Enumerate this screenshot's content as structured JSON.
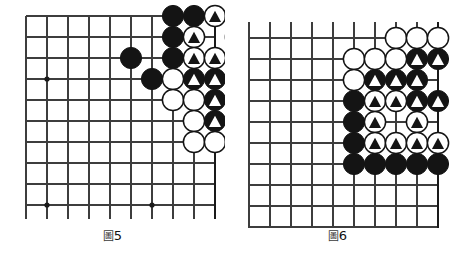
{
  "page": {
    "background": "#ffffff",
    "width": 450,
    "height": 261
  },
  "colors": {
    "line": "#3d3d3d",
    "border": "#1a1a1a",
    "black_stone": "#141414",
    "white_stone": "#ffffff",
    "stone_outline": "#141414",
    "mark_on_black": "#ffffff",
    "mark_on_white": "#141414",
    "star_point": "#1a1a1a",
    "caption_text": "#111111"
  },
  "figures": [
    {
      "id": "figure-5",
      "caption_cjk": "圖",
      "caption_number": "5",
      "caption_full": "圖5",
      "grid": {
        "cols": 10,
        "rows": 10,
        "x0": 26,
        "y0": 16,
        "spacing": 21,
        "edges": {
          "top": false,
          "right": true,
          "bottom": false,
          "left": false
        },
        "lines_overhang": {
          "top": 0,
          "bottom": 14,
          "left": 0,
          "right": 0
        }
      },
      "star_points": [
        {
          "col": 2,
          "row": 4
        },
        {
          "col": 2,
          "row": 10
        },
        {
          "col": 7,
          "row": 10
        }
      ],
      "stones": [
        {
          "col": 8,
          "row": 1,
          "color": "black",
          "mark": "none"
        },
        {
          "col": 9,
          "row": 1,
          "color": "black",
          "mark": "none"
        },
        {
          "col": 10,
          "row": 1,
          "color": "white",
          "mark": "triangle"
        },
        {
          "col": 11,
          "row": 1,
          "color": "white",
          "mark": "triangle"
        },
        {
          "col": 8,
          "row": 2,
          "color": "black",
          "mark": "none"
        },
        {
          "col": 9,
          "row": 2,
          "color": "white",
          "mark": "triangle"
        },
        {
          "col": 11,
          "row": 2,
          "color": "white",
          "mark": "triangle"
        },
        {
          "col": 6,
          "row": 3,
          "color": "black",
          "mark": "none"
        },
        {
          "col": 8,
          "row": 3,
          "color": "black",
          "mark": "none"
        },
        {
          "col": 9,
          "row": 3,
          "color": "white",
          "mark": "triangle"
        },
        {
          "col": 10,
          "row": 3,
          "color": "white",
          "mark": "triangle"
        },
        {
          "col": 7,
          "row": 4,
          "color": "black",
          "mark": "none"
        },
        {
          "col": 8,
          "row": 4,
          "color": "white",
          "mark": "none"
        },
        {
          "col": 9,
          "row": 4,
          "color": "black",
          "mark": "triangle"
        },
        {
          "col": 10,
          "row": 4,
          "color": "black",
          "mark": "triangle"
        },
        {
          "col": 11,
          "row": 4,
          "color": "black",
          "mark": "triangle"
        },
        {
          "col": 8,
          "row": 5,
          "color": "white",
          "mark": "none"
        },
        {
          "col": 9,
          "row": 5,
          "color": "white",
          "mark": "none"
        },
        {
          "col": 10,
          "row": 5,
          "color": "black",
          "mark": "triangle"
        },
        {
          "col": 9,
          "row": 6,
          "color": "white",
          "mark": "none"
        },
        {
          "col": 10,
          "row": 6,
          "color": "black",
          "mark": "triangle"
        },
        {
          "col": 11,
          "row": 6,
          "color": "black",
          "mark": "triangle"
        },
        {
          "col": 9,
          "row": 7,
          "color": "white",
          "mark": "none"
        },
        {
          "col": 10,
          "row": 7,
          "color": "white",
          "mark": "none"
        },
        {
          "col": 11,
          "row": 7,
          "color": "white",
          "mark": "none"
        }
      ]
    },
    {
      "id": "figure-6",
      "caption_cjk": "圖",
      "caption_number": "6",
      "caption_full": "圖6",
      "grid": {
        "cols": 10,
        "rows": 10,
        "x0": 24,
        "y0": 38,
        "spacing": 21,
        "edges": {
          "top": false,
          "right": true,
          "bottom": false,
          "left": false
        },
        "lines_overhang": {
          "top": 16,
          "bottom": 14,
          "left": 0,
          "right": 0
        }
      },
      "star_points": [],
      "stones": [
        {
          "col": 8,
          "row": 1,
          "color": "white",
          "mark": "none"
        },
        {
          "col": 9,
          "row": 1,
          "color": "white",
          "mark": "none"
        },
        {
          "col": 10,
          "row": 1,
          "color": "white",
          "mark": "none"
        },
        {
          "col": 6,
          "row": 2,
          "color": "white",
          "mark": "none"
        },
        {
          "col": 7,
          "row": 2,
          "color": "white",
          "mark": "none"
        },
        {
          "col": 8,
          "row": 2,
          "color": "white",
          "mark": "none"
        },
        {
          "col": 9,
          "row": 2,
          "color": "black",
          "mark": "triangle"
        },
        {
          "col": 10,
          "row": 2,
          "color": "black",
          "mark": "triangle"
        },
        {
          "col": 6,
          "row": 3,
          "color": "white",
          "mark": "none"
        },
        {
          "col": 7,
          "row": 3,
          "color": "black",
          "mark": "triangle"
        },
        {
          "col": 8,
          "row": 3,
          "color": "black",
          "mark": "triangle"
        },
        {
          "col": 9,
          "row": 3,
          "color": "black",
          "mark": "triangle"
        },
        {
          "col": 6,
          "row": 4,
          "color": "black",
          "mark": "none"
        },
        {
          "col": 7,
          "row": 4,
          "color": "white",
          "mark": "triangle"
        },
        {
          "col": 8,
          "row": 4,
          "color": "white",
          "mark": "triangle"
        },
        {
          "col": 9,
          "row": 4,
          "color": "black",
          "mark": "triangle"
        },
        {
          "col": 10,
          "row": 4,
          "color": "black",
          "mark": "triangle"
        },
        {
          "col": 6,
          "row": 5,
          "color": "black",
          "mark": "none"
        },
        {
          "col": 7,
          "row": 5,
          "color": "white",
          "mark": "triangle"
        },
        {
          "col": 9,
          "row": 5,
          "color": "white",
          "mark": "triangle"
        },
        {
          "col": 6,
          "row": 6,
          "color": "black",
          "mark": "none"
        },
        {
          "col": 7,
          "row": 6,
          "color": "white",
          "mark": "triangle"
        },
        {
          "col": 8,
          "row": 6,
          "color": "white",
          "mark": "triangle"
        },
        {
          "col": 9,
          "row": 6,
          "color": "white",
          "mark": "triangle"
        },
        {
          "col": 10,
          "row": 6,
          "color": "white",
          "mark": "triangle"
        },
        {
          "col": 6,
          "row": 7,
          "color": "black",
          "mark": "none"
        },
        {
          "col": 7,
          "row": 7,
          "color": "black",
          "mark": "none"
        },
        {
          "col": 8,
          "row": 7,
          "color": "black",
          "mark": "none"
        },
        {
          "col": 9,
          "row": 7,
          "color": "black",
          "mark": "none"
        },
        {
          "col": 10,
          "row": 7,
          "color": "black",
          "mark": "none"
        }
      ]
    }
  ]
}
